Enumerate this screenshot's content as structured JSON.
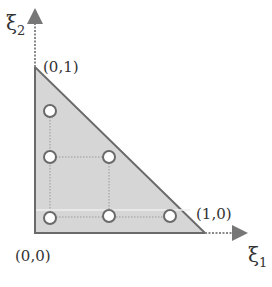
{
  "diagram": {
    "axes": {
      "x_label": "ξ",
      "x_subscript": "1",
      "y_label": "ξ",
      "y_subscript": "2"
    },
    "vertices": [
      {
        "label": "(0,0)",
        "x": 35,
        "y": 233
      },
      {
        "label": "(1,0)",
        "x": 205,
        "y": 233
      },
      {
        "label": "(0,1)",
        "x": 35,
        "y": 67
      }
    ],
    "points": [
      {
        "x": 50,
        "y": 111
      },
      {
        "x": 50,
        "y": 157
      },
      {
        "x": 109,
        "y": 157
      },
      {
        "x": 50,
        "y": 218
      },
      {
        "x": 109,
        "y": 216
      },
      {
        "x": 170,
        "y": 216
      }
    ],
    "colors": {
      "fill": "#d6d6d6",
      "edge": "#6a6a6a",
      "point_stroke": "#6a6a6a",
      "axis": "#888888"
    }
  }
}
